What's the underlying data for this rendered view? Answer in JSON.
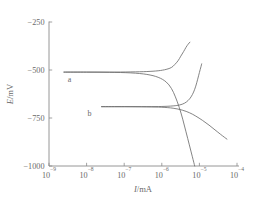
{
  "chart_data": {
    "type": "line",
    "title": "",
    "xlabel": "I/mA",
    "ylabel": "E/mV",
    "xscale": "log",
    "xlim": [
      1e-09,
      0.0001
    ],
    "ylim": [
      -1000,
      -250
    ],
    "grid": false,
    "legend": "none",
    "xticks": [
      {
        "value": 1e-09,
        "mantissa": "10",
        "exponent": "-9"
      },
      {
        "value": 1e-08,
        "mantissa": "10",
        "exponent": "-8"
      },
      {
        "value": 1e-07,
        "mantissa": "10",
        "exponent": "-7"
      },
      {
        "value": 1e-06,
        "mantissa": "10",
        "exponent": "-6"
      },
      {
        "value": 1e-05,
        "mantissa": "10",
        "exponent": "-5"
      },
      {
        "value": 0.0001,
        "mantissa": "10",
        "exponent": "-4"
      }
    ],
    "yticks": [
      {
        "value": -250,
        "label": "-250"
      },
      {
        "value": -500,
        "label": "-500"
      },
      {
        "value": -750,
        "label": "-750"
      },
      {
        "value": -1000,
        "label": "-1000"
      }
    ],
    "annotations": [
      {
        "name": "curve-a-label",
        "text": "a",
        "x": 3.5e-09,
        "y": -560
      },
      {
        "name": "curve-b-label",
        "text": "b",
        "x": 1.2e-08,
        "y": -740
      }
    ],
    "series": [
      {
        "name": "a",
        "label": "a",
        "corrosion_potential": -510,
        "corrosion_current": 2.2e-06,
        "anodic_branch": [
          [
            2.5e-09,
            -511
          ],
          [
            1e-08,
            -511
          ],
          [
            4e-08,
            -511
          ],
          [
            1.5e-07,
            -510
          ],
          [
            4e-07,
            -508
          ],
          [
            8e-07,
            -504
          ],
          [
            1.3e-06,
            -497
          ],
          [
            1.8e-06,
            -487
          ],
          [
            2.2e-06,
            -472
          ],
          [
            2.7e-06,
            -452
          ],
          [
            3.2e-06,
            -428
          ],
          [
            3.8e-06,
            -404
          ],
          [
            4.4e-06,
            -382
          ],
          [
            5e-06,
            -366
          ],
          [
            5.6e-06,
            -355
          ]
        ],
        "cathodic_branch": [
          [
            2.5e-09,
            -511
          ],
          [
            1e-08,
            -511
          ],
          [
            4e-08,
            -512
          ],
          [
            1.5e-07,
            -515
          ],
          [
            4e-07,
            -523
          ],
          [
            8e-07,
            -538
          ],
          [
            1.3e-06,
            -562
          ],
          [
            1.8e-06,
            -596
          ],
          [
            2.3e-06,
            -640
          ],
          [
            2.9e-06,
            -694
          ],
          [
            3.6e-06,
            -756
          ],
          [
            4.4e-06,
            -822
          ],
          [
            5.4e-06,
            -890
          ],
          [
            6.5e-06,
            -952
          ],
          [
            7.5e-06,
            -1000
          ]
        ]
      },
      {
        "name": "b",
        "label": "b",
        "corrosion_potential": -690,
        "corrosion_current": 3.5e-06,
        "anodic_branch": [
          [
            2.5e-08,
            -691
          ],
          [
            1e-07,
            -691
          ],
          [
            4e-07,
            -691
          ],
          [
            1e-06,
            -690
          ],
          [
            2e-06,
            -687
          ],
          [
            3e-06,
            -682
          ],
          [
            4e-06,
            -673
          ],
          [
            5e-06,
            -659
          ],
          [
            6e-06,
            -640
          ],
          [
            7e-06,
            -615
          ],
          [
            8e-06,
            -584
          ],
          [
            9e-06,
            -548
          ],
          [
            1e-05,
            -513
          ],
          [
            1.1e-05,
            -483
          ],
          [
            1.15e-05,
            -468
          ]
        ],
        "cathodic_branch": [
          [
            2.5e-08,
            -691
          ],
          [
            1e-07,
            -691
          ],
          [
            4e-07,
            -692
          ],
          [
            1e-06,
            -694
          ],
          [
            2e-06,
            -699
          ],
          [
            3.5e-06,
            -709
          ],
          [
            5.5e-06,
            -723
          ],
          [
            8e-06,
            -740
          ],
          [
            1.2e-05,
            -762
          ],
          [
            1.8e-05,
            -787
          ],
          [
            2.6e-05,
            -812
          ],
          [
            3.6e-05,
            -834
          ],
          [
            4.6e-05,
            -850
          ],
          [
            5.4e-05,
            -860
          ]
        ]
      }
    ]
  }
}
